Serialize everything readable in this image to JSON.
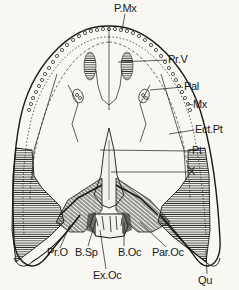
{
  "figure": {
    "labels": {
      "pmx": "P.Mx",
      "prv": "Pr.V",
      "pal": "Pal",
      "mx": "Mx",
      "ectpt": "Ect.Pt",
      "pt": "Pt",
      "x": "X",
      "pro": "Pr.O",
      "bsp": "B.Sp",
      "boc": "B.Oc",
      "paroc": "Par.Oc",
      "exoc": "Ex.Oc",
      "qu": "Qu"
    },
    "colors": {
      "ink": "#1a1a1a",
      "paper": "#f8f7f2"
    }
  }
}
